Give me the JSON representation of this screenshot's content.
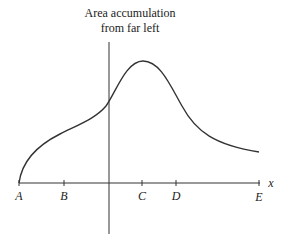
{
  "title_line1": "Area accumulation",
  "title_line2": "from far left",
  "axis_label": "x",
  "points": [
    {
      "label": "A",
      "x": 19
    },
    {
      "label": "B",
      "x": 64
    },
    {
      "label": "C",
      "x": 142
    },
    {
      "label": "D",
      "x": 176
    },
    {
      "label": "E",
      "x": 259
    }
  ],
  "colors": {
    "line": "#333333",
    "text": "#222222"
  }
}
